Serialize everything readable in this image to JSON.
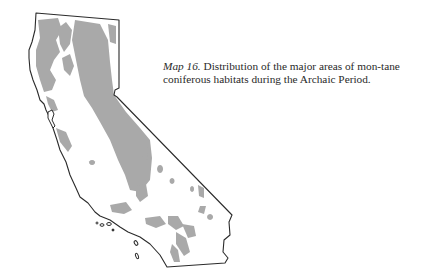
{
  "figure": {
    "label": "Map 16.",
    "caption_text": " Distribution of the major areas of mon-tane coniferous habitats during the Archaic Period.",
    "caption_lines": [
      "Distribution of the major areas of mon-",
      "tane coniferous habitats during the Archaic",
      "Period."
    ]
  },
  "map": {
    "region": "California",
    "shaded_meaning": "montane coniferous habitat",
    "colors": {
      "outline": "#2b2b2b",
      "habitat_fill": "#a9a9a9",
      "background": "#ffffff"
    }
  }
}
